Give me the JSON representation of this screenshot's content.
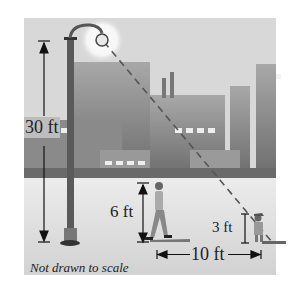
{
  "diagram": {
    "labels": {
      "pole_height": "30 ft",
      "person_height": "6 ft",
      "child_height": "3 ft",
      "distance": "10 ft",
      "note": "Not drawn to scale"
    },
    "colors": {
      "sky": "#d6d6d6",
      "buildings": "#8e8e8e",
      "ground": "#e0e0e0",
      "pole": "#555555",
      "glow": "#f4f4f4"
    }
  }
}
